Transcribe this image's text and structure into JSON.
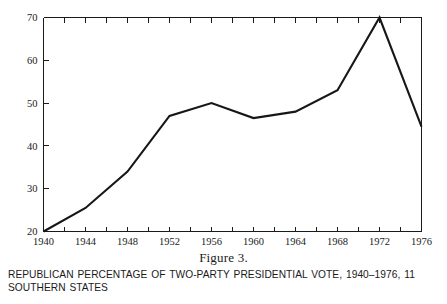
{
  "figure": {
    "number_label": "Figure 3.",
    "caption": "REPUBLICAN PERCENTAGE OF TWO-PARTY PRESIDENTIAL VOTE, 1940–1976, 11 SOUTHERN STATES"
  },
  "chart_data": {
    "type": "line",
    "title": "REPUBLICAN PERCENTAGE OF TWO-PARTY PRESIDENTIAL VOTE, 1940–1976, 11 SOUTHERN STATES",
    "xlabel": "",
    "ylabel": "",
    "x": [
      1940,
      1944,
      1948,
      1952,
      1956,
      1960,
      1964,
      1968,
      1972,
      1976
    ],
    "values": [
      20,
      25.5,
      34,
      47,
      50,
      46.5,
      48,
      53,
      70,
      44.5
    ],
    "xlim": [
      1940,
      1976
    ],
    "ylim": [
      20,
      70
    ],
    "x_tick_labels": [
      "1940",
      "1944",
      "1948",
      "1952",
      "1956",
      "1960",
      "1964",
      "1968",
      "1972",
      "1976"
    ],
    "x_tick_values": [
      1940,
      1944,
      1948,
      1952,
      1956,
      1960,
      1964,
      1968,
      1972,
      1976
    ],
    "x_minor_tick_values": [
      1940,
      1942,
      1944,
      1946,
      1948,
      1950,
      1952,
      1954,
      1956,
      1958,
      1960,
      1962,
      1964,
      1966,
      1968,
      1970,
      1972,
      1974,
      1976
    ],
    "y_tick_labels": [
      "20",
      "30",
      "40",
      "50",
      "60",
      "70"
    ],
    "y_tick_values": [
      20,
      30,
      40,
      50,
      60,
      70
    ],
    "grid": false,
    "legend": null,
    "series_color": "#171717",
    "axis_color": "#1a1a1a"
  }
}
